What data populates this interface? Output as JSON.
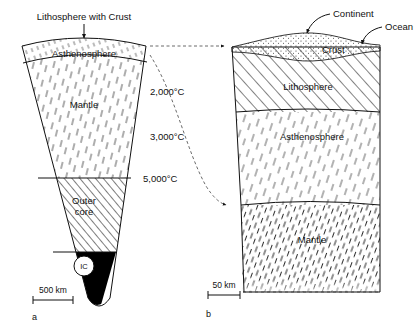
{
  "figure": {
    "panels": [
      {
        "id": "a",
        "label": "a",
        "scale_label": "500 km",
        "callout": "Lithosphere with Crust",
        "layers": [
          {
            "name": "Asthenosphere"
          },
          {
            "name": "Mantle"
          },
          {
            "name": "Outer core"
          },
          {
            "name": "IC"
          }
        ],
        "temperatures": [
          "2,000°C",
          "3,000°C",
          "5,000°C"
        ]
      },
      {
        "id": "b",
        "label": "b",
        "scale_label": "50 km",
        "callouts": [
          "Continent",
          "Ocean"
        ],
        "layers": [
          {
            "name": "Crust"
          },
          {
            "name": "Lithosphere"
          },
          {
            "name": "Asthenosphere"
          },
          {
            "name": "Mantle"
          }
        ]
      }
    ],
    "outer_core_line1": "Outer",
    "outer_core_line2": "core",
    "colors": {
      "ink": "#111111",
      "hatch": "#333333",
      "background": "#ffffff",
      "core": "#000000"
    }
  }
}
